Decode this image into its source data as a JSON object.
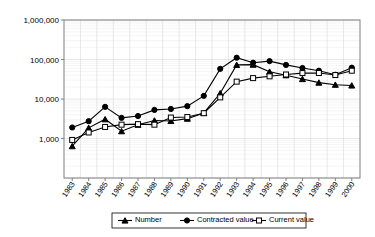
{
  "chart_data": {
    "type": "line",
    "title": "",
    "subtitle": "",
    "xlabel": "",
    "ylabel": "",
    "yscale": "log",
    "ylim": [
      100,
      1000000
    ],
    "grid": true,
    "legend_position": "bottom",
    "ytick_labels": [
      "1,000,000",
      "100,000",
      "10,000",
      "1,000"
    ],
    "ytick_values": [
      1000000,
      100000,
      10000,
      1000
    ],
    "categories": [
      "1983",
      "1984",
      "1985",
      "1986",
      "1987",
      "1988",
      "1989",
      "1990",
      "1991",
      "1992",
      "1993",
      "1994",
      "1995",
      "1996",
      "1997",
      "1998",
      "1999",
      "2000"
    ],
    "series": [
      {
        "name": "Number",
        "marker": "triangle",
        "values": [
          640,
          1860,
          3070,
          1530,
          2230,
          2850,
          2780,
          3180,
          4440,
          14000,
          73000,
          74000,
          49000,
          40000,
          32000,
          26000,
          23000,
          22000
        ]
      },
      {
        "name": "Contracted value",
        "marker": "circle",
        "values": [
          1900,
          2740,
          6330,
          3330,
          3710,
          5300,
          5600,
          6600,
          12000,
          58000,
          111000,
          83000,
          91000,
          73000,
          61000,
          52000,
          41000,
          62000
        ]
      },
      {
        "name": "Current value",
        "marker": "square",
        "values": [
          920,
          1420,
          1960,
          2240,
          2310,
          2240,
          3390,
          3490,
          4370,
          11000,
          27500,
          33800,
          37500,
          41700,
          45300,
          45500,
          40400,
          52000
        ]
      }
    ]
  },
  "legend": {
    "items": [
      {
        "label": "Number",
        "marker": "triangle"
      },
      {
        "label": "Contracted value",
        "marker": "circle"
      },
      {
        "label": "Current value",
        "marker": "square"
      }
    ]
  }
}
